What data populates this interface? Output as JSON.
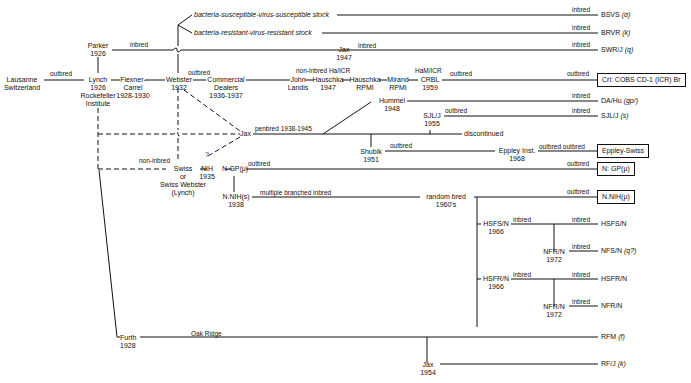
{
  "nodes": {
    "lausanne": [
      "Lausanne",
      "Switzerland"
    ],
    "parker": [
      "Parker",
      "1926"
    ],
    "lynch": [
      "Lynch",
      "1926",
      "Rockefeller",
      "Institute"
    ],
    "flexner": [
      "Flexner-",
      "Carrel",
      "1928-1930"
    ],
    "webster": [
      "Webster",
      "1932"
    ],
    "commercial": [
      "Commercial",
      "Dealers",
      "1936-1937"
    ],
    "jax1947": [
      "Jax",
      "1947"
    ],
    "john_landis": [
      "John",
      "Landis"
    ],
    "hauschka1947": [
      "Hauschka",
      "1947"
    ],
    "hauschka_rpmi": [
      "Hauschka",
      "RPMI"
    ],
    "mirand": [
      "Mirand",
      "RPMI"
    ],
    "crbl": [
      "CRBL",
      "1959"
    ],
    "hummel": [
      "Hummel",
      "1948"
    ],
    "sjl1955": [
      "SJL/J",
      "1955"
    ],
    "jax_center": "Jax",
    "shubik": [
      "Shubik",
      "1951"
    ],
    "eppley_inst": [
      "Eppley Inst.",
      "1968"
    ],
    "swiss": [
      "Swiss",
      "or",
      "Swiss Webster",
      "(Lynch)"
    ],
    "nih1935": [
      "NIH",
      "1935"
    ],
    "ngp": "N-GP(μ)",
    "nnih1938": [
      "N.NIH(s)",
      "1938"
    ],
    "question": "?",
    "random_bred": [
      "random bred",
      "1960's"
    ],
    "hsfs1966": [
      "HSFS/N",
      "1966"
    ],
    "nfr1972a": [
      "NFR/N",
      "1972"
    ],
    "hsfr1966": [
      "HSFR/N",
      "1966"
    ],
    "nfr1972b": [
      "NFR/N",
      "1972"
    ],
    "furth": [
      "Furth",
      "1928"
    ],
    "jax1954": [
      "Jax",
      "1954"
    ],
    "bs_stock": "bacteria-susceptible-virus-susceptible stock",
    "br_stock": "bacteria-resistant-virus-resistant stock",
    "discontinued": "discontinued"
  },
  "edge_labels": {
    "outbred": "outbred",
    "inbred": "inbred",
    "non_inbred": "non-inbred",
    "non_inbred_ha": "non-inbred Ha/ICR",
    "ham_icr": "HaM/ICR",
    "penbred": "penbred 1938-1945",
    "multiple": "multiple branched inbred",
    "outbred_outbred": "outbred outbred",
    "oak_ridge": "Oak Ridge"
  },
  "terminals": [
    {
      "name": "BSVS",
      "gene": "(α)",
      "boxed": false
    },
    {
      "name": "BRVR",
      "gene": "(k)",
      "boxed": false
    },
    {
      "name": "SWR/J",
      "gene": "(q)",
      "boxed": false
    },
    {
      "name": "Crl: COBS CD-1 (ICR) Br",
      "gene": "",
      "boxed": true
    },
    {
      "name": "DA/Hu",
      "gene": "(gp/)",
      "boxed": false
    },
    {
      "name": "SJL/J",
      "gene": "(s)",
      "boxed": false
    },
    {
      "name": "Eppley-Swiss",
      "gene": "",
      "boxed": true
    },
    {
      "name": "N: GP(μ)",
      "gene": "",
      "boxed": true
    },
    {
      "name": "N.NIH(μ)",
      "gene": "",
      "boxed": true
    },
    {
      "name": "HSFS/N",
      "gene": "",
      "boxed": false
    },
    {
      "name": "NFS/N",
      "gene": "(q?)",
      "boxed": false
    },
    {
      "name": "HSFR/N",
      "gene": "",
      "boxed": false
    },
    {
      "name": "NFR/N",
      "gene": "",
      "boxed": false
    },
    {
      "name": "RFM",
      "gene": "(f)",
      "boxed": false
    },
    {
      "name": "RF/J",
      "gene": "(k)",
      "boxed": false
    }
  ]
}
